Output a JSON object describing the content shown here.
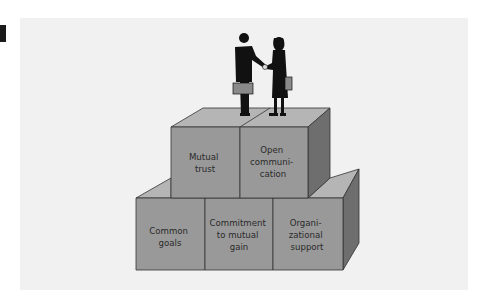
{
  "figure": {
    "marker_color": "#1a1a1a",
    "panel_color": "#f1f1f1",
    "box_front_color": "#999999",
    "box_top_color": "#b5b5b5",
    "box_side_color": "#6e6e6e",
    "illustration": "two businesspeople shaking hands on top of the blocks"
  },
  "blocks": {
    "top": [
      {
        "lines": [
          "Mutual",
          "trust"
        ]
      },
      {
        "lines": [
          "Open",
          "communi-",
          "cation"
        ]
      }
    ],
    "bottom": [
      {
        "lines": [
          "Common",
          "goals"
        ]
      },
      {
        "lines": [
          "Commitment",
          "to mutual",
          "gain"
        ]
      },
      {
        "lines": [
          "Organi-",
          "zational",
          "support"
        ]
      }
    ]
  }
}
